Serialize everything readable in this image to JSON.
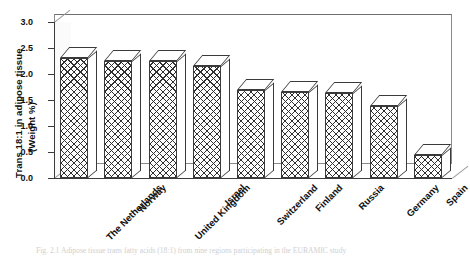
{
  "figure": {
    "caption": "Fig. 2.1  Adipose tissue trans fatty acids (18:1) from nine regions participating in the EURAMIC study"
  },
  "chart_data": {
    "type": "bar",
    "title": "",
    "xlabel": "",
    "ylabel": "Trans 18:1 in adipose tissue (Weight %)",
    "ylabel_line1": "Trans 18:1 in adipose tissue",
    "ylabel_line2": "(Weight %)",
    "categories": [
      "The Netherlands",
      "Norway",
      "United Kingdom",
      "Israel",
      "Switzerland",
      "Finland",
      "Russia",
      "Germany",
      "Spain"
    ],
    "values": [
      2.31,
      2.25,
      2.25,
      2.15,
      1.7,
      1.65,
      1.63,
      1.38,
      0.44
    ],
    "ylim": [
      0.0,
      3.0
    ],
    "ytick_labels": [
      "0.0",
      "0.5",
      "1.0",
      "1.5",
      "2.0",
      "2.5",
      "3.0"
    ],
    "ytick_values": [
      0.0,
      0.5,
      1.0,
      1.5,
      2.0,
      2.5,
      3.0
    ],
    "grid": false,
    "legend": null,
    "style": "3d-columns-crosshatch",
    "colors": {
      "bar_outline": "#3a3a3a",
      "bar_fill": "#ffffff",
      "hatch": "#2f2f2f",
      "axis": "#3b3b3b",
      "frame": "#8a8a8a"
    }
  }
}
